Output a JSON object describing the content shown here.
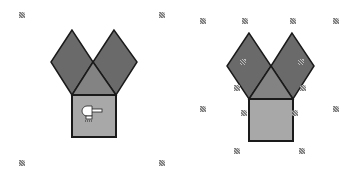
{
  "figures": [
    {
      "name": "left-figure",
      "state": "selected-with-cursor",
      "colors": {
        "diamond": "#6a6a6a",
        "triangle": "#838383",
        "square": "#a8a8a8",
        "stroke": "#1a1a1a"
      },
      "shapes": {
        "left_diamond": "72,30 51,62 72,95 93,62",
        "right_diamond": "114,30 93,62 116,95 137,62",
        "triangle": "72,95 116,95 93,62",
        "square": {
          "x": 72,
          "y": 95,
          "w": 44,
          "h": 42
        }
      },
      "cursor": "hammer-cursor",
      "handles": [
        [
          22,
          15
        ],
        [
          162,
          15
        ],
        [
          22,
          163
        ],
        [
          162,
          163
        ]
      ]
    },
    {
      "name": "right-figure",
      "state": "selected-with-resize-handles",
      "colors": {
        "diamond": "#6a6a6a",
        "triangle": "#838383",
        "square": "#a8a8a8",
        "stroke": "#1a1a1a"
      },
      "shapes": {
        "left_diamond": "249,33 227,66 249,99 271,66",
        "right_diamond": "292,33 271,66 293,99 314,66",
        "triangle": "249,99 293,99 271,66",
        "square": {
          "x": 249,
          "y": 99,
          "w": 44,
          "h": 42
        }
      },
      "handles": [
        [
          203,
          21
        ],
        [
          245,
          21
        ],
        [
          293,
          21
        ],
        [
          336,
          21
        ],
        [
          243,
          62
        ],
        [
          301,
          62
        ],
        [
          237,
          88
        ],
        [
          303,
          88
        ],
        [
          203,
          109
        ],
        [
          336,
          109
        ],
        [
          244,
          113
        ],
        [
          295,
          113
        ],
        [
          237,
          151
        ],
        [
          302,
          151
        ]
      ]
    }
  ]
}
